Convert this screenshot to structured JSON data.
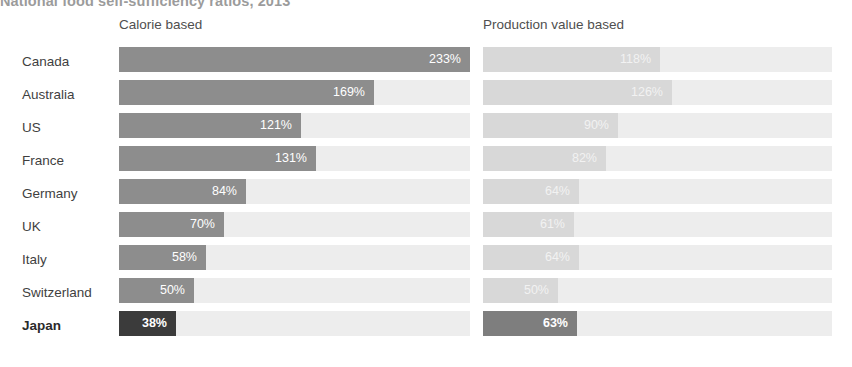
{
  "title": "National food self-sufficiency ratios, 2013",
  "columns": {
    "calorie_label": "Calorie based",
    "production_label": "Production value based"
  },
  "colors": {
    "bar_calorie": "#8d8d8d",
    "bar_production": "#d8d8d8",
    "bar_highlight_calorie": "#3b3b3b",
    "bar_highlight_production": "#7e7e7e",
    "track": "#ededed",
    "text": "#3f3f3f"
  },
  "chart_data": {
    "type": "bar",
    "title": "National food self-sufficiency ratios, 2013",
    "xlabel": "",
    "ylabel": "",
    "orientation": "horizontal",
    "grid": false,
    "legend": "none",
    "xlim": [
      0,
      233
    ],
    "categories": [
      "Canada",
      "Australia",
      "US",
      "France",
      "Germany",
      "UK",
      "Italy",
      "Switzerland",
      "Japan"
    ],
    "highlight_category": "Japan",
    "series": [
      {
        "name": "Calorie based",
        "values": [
          233,
          169,
          121,
          131,
          84,
          70,
          58,
          50,
          38
        ],
        "labels": [
          "233%",
          "169%",
          "121%",
          "131%",
          "84%",
          "70%",
          "58%",
          "50%",
          "38%"
        ]
      },
      {
        "name": "Production value based",
        "values": [
          118,
          126,
          90,
          82,
          64,
          61,
          64,
          50,
          63
        ],
        "labels": [
          "118%",
          "126%",
          "90%",
          "82%",
          "64%",
          "61%",
          "64%",
          "50%",
          "63%"
        ]
      }
    ]
  },
  "rows": [
    {
      "country": "Canada",
      "calorie": "233%",
      "calorie_pct": 233,
      "production": "118%",
      "production_pct": 118,
      "highlight": false
    },
    {
      "country": "Australia",
      "calorie": "169%",
      "calorie_pct": 169,
      "production": "126%",
      "production_pct": 126,
      "highlight": false
    },
    {
      "country": "US",
      "calorie": "121%",
      "calorie_pct": 121,
      "production": "90%",
      "production_pct": 90,
      "highlight": false
    },
    {
      "country": "France",
      "calorie": "131%",
      "calorie_pct": 131,
      "production": "82%",
      "production_pct": 82,
      "highlight": false
    },
    {
      "country": "Germany",
      "calorie": "84%",
      "calorie_pct": 84,
      "production": "64%",
      "production_pct": 64,
      "highlight": false
    },
    {
      "country": "UK",
      "calorie": "70%",
      "calorie_pct": 70,
      "production": "61%",
      "production_pct": 61,
      "highlight": false
    },
    {
      "country": "Italy",
      "calorie": "58%",
      "calorie_pct": 58,
      "production": "64%",
      "production_pct": 64,
      "highlight": false
    },
    {
      "country": "Switzerland",
      "calorie": "50%",
      "calorie_pct": 50,
      "production": "50%",
      "production_pct": 50,
      "highlight": false
    },
    {
      "country": "Japan",
      "calorie": "38%",
      "calorie_pct": 38,
      "production": "63%",
      "production_pct": 63,
      "highlight": true
    }
  ]
}
